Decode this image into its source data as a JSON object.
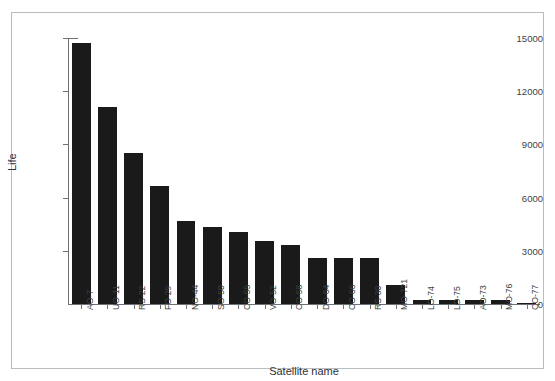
{
  "figure": {
    "top_strip_text": "",
    "background_color": "#ffffff",
    "border_color": "#b9bcc0",
    "bar_color": "#1a1a1a",
    "axis_color": "#6f7276"
  },
  "chart_data": {
    "type": "bar",
    "title": "",
    "xlabel": "Satellite name",
    "ylabel": "Life",
    "categories": [
      "AO-7",
      "UO-11",
      "RS-22",
      "FO-29",
      "NO-44",
      "SO-50",
      "CO-55",
      "VO-52",
      "CO-58",
      "DO-64",
      "CO-66",
      "RS-30",
      "MO-721",
      "LO-74",
      "LO-75",
      "AO-73",
      "MO-76",
      "CO-77"
    ],
    "values": [
      14700,
      11100,
      8500,
      6650,
      4700,
      4350,
      4050,
      3550,
      3350,
      2600,
      2600,
      2600,
      1100,
      250,
      220,
      220,
      250,
      60
    ],
    "ylim": [
      0,
      15000
    ],
    "yticks": [
      0,
      3000,
      6000,
      9000,
      12000,
      15000
    ],
    "ytick_labels": [
      "0",
      "3000",
      "6000",
      "9000",
      "12000",
      "15000"
    ],
    "grid": false,
    "legend": null,
    "orientation": "vertical"
  }
}
